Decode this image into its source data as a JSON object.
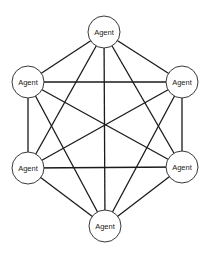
{
  "diagram": {
    "type": "fully-connected-graph",
    "node_radius": 16,
    "colors": {
      "edge": "#1a1a1a",
      "node_stroke": "#3a3a3a",
      "node_fill": "#ffffff",
      "text": "#222222",
      "background": "#ffffff"
    },
    "nodes": [
      {
        "id": "top",
        "label": "Agent",
        "x": 104,
        "y": 32
      },
      {
        "id": "upper-left",
        "label": "Agent",
        "x": 28,
        "y": 82
      },
      {
        "id": "upper-right",
        "label": "Agent",
        "x": 182,
        "y": 82
      },
      {
        "id": "lower-left",
        "label": "Agent",
        "x": 28,
        "y": 168
      },
      {
        "id": "lower-right",
        "label": "Agent",
        "x": 182,
        "y": 167
      },
      {
        "id": "bottom",
        "label": "Agent",
        "x": 105,
        "y": 226
      }
    ],
    "edges": [
      [
        "top",
        "upper-left"
      ],
      [
        "top",
        "upper-right"
      ],
      [
        "top",
        "lower-left"
      ],
      [
        "top",
        "lower-right"
      ],
      [
        "top",
        "bottom"
      ],
      [
        "upper-left",
        "upper-right"
      ],
      [
        "upper-left",
        "lower-left"
      ],
      [
        "upper-left",
        "lower-right"
      ],
      [
        "upper-left",
        "bottom"
      ],
      [
        "upper-right",
        "lower-left"
      ],
      [
        "upper-right",
        "lower-right"
      ],
      [
        "upper-right",
        "bottom"
      ],
      [
        "lower-left",
        "lower-right"
      ],
      [
        "lower-left",
        "bottom"
      ],
      [
        "lower-right",
        "bottom"
      ]
    ]
  }
}
